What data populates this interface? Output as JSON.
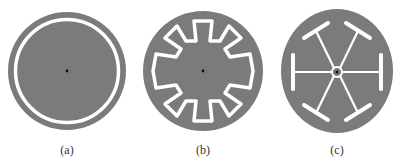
{
  "colors": {
    "disc": "#7b7b7b",
    "slot": "#ffffff",
    "dot": "#111111",
    "label": "#333333"
  },
  "figures": [
    {
      "id": "a",
      "label": "(a)",
      "description": "disc with concentric annular slot"
    },
    {
      "id": "b",
      "label": "(b)",
      "description": "disc with gear-shaped (zigzag) closed slot, 10 inward notches"
    },
    {
      "id": "c",
      "label": "(c)",
      "description": "disc with six radial spokes ending in T-bars and central ring"
    }
  ]
}
